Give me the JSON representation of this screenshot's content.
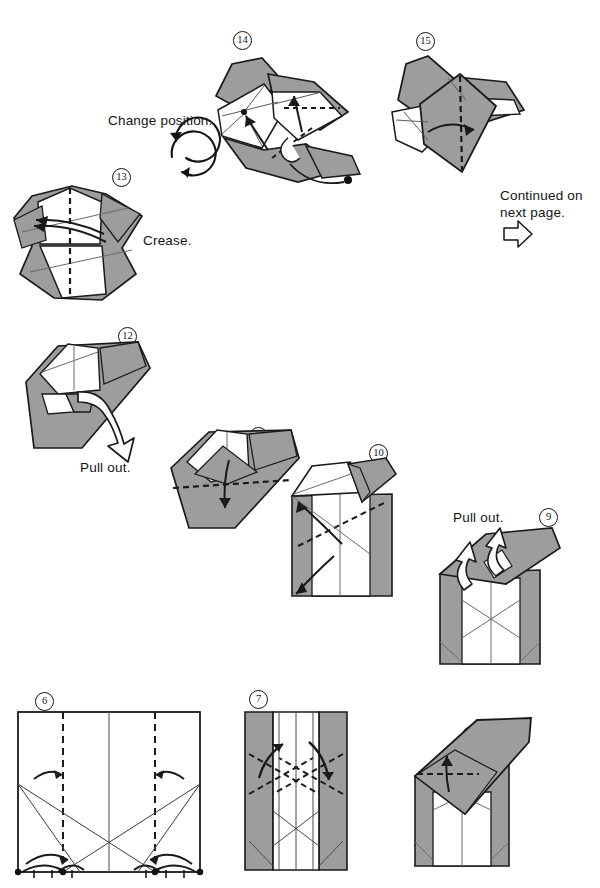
{
  "page": {
    "kind": "origami-instruction-diagram",
    "width": 600,
    "height": 888,
    "background": "#ffffff"
  },
  "colors": {
    "paper_front": "#ffffff",
    "paper_back": "#9d9d9d",
    "paper_back_shade": "#8d8d8d",
    "outline": "#1a1a1a",
    "crease_thin": "#5a5a5a",
    "text": "#141414"
  },
  "captions": [
    {
      "id": "change-position",
      "text": "Change position.",
      "x": 108,
      "y": 120
    },
    {
      "id": "crease",
      "text": "Crease.",
      "x": 143,
      "y": 232
    },
    {
      "id": "continued",
      "line1": "Continued on",
      "line2": "next page.",
      "x": 500,
      "y": 190
    },
    {
      "id": "pull-out-12",
      "text": "Pull out.",
      "x": 80,
      "y": 460
    },
    {
      "id": "pull-out-9",
      "text": "Pull out.",
      "x": 453,
      "y": 510
    }
  ],
  "icons": [
    {
      "name": "rotate-icon",
      "label": "change-position-rotation",
      "x": 163,
      "y": 135,
      "r": 24
    },
    {
      "name": "continue-arrow-icon",
      "label": "hollow-right-arrow",
      "x": 512,
      "y": 228
    }
  ],
  "steps": [
    {
      "number": "6",
      "glyph": "⑥",
      "label_x": 35,
      "label_y": 696,
      "fig_x": 12,
      "fig_y": 708,
      "fig_w": 195,
      "fig_h": 168,
      "caption": "",
      "note": "flat square, two dashed vertical valley folds, thin X creases, four curved arrows, four corner dots"
    },
    {
      "number": "7",
      "glyph": "⑦",
      "label_x": 249,
      "label_y": 694,
      "fig_x": 243,
      "fig_y": 708,
      "fig_w": 105,
      "fig_h": 165,
      "caption": "",
      "note": "rectangle with grey side panels and dashed X folds, two bold arrows"
    },
    {
      "number": "8",
      "glyph": "⑧",
      "label_x": 462,
      "label_y": 730,
      "fig_x": 405,
      "fig_y": 718,
      "fig_w": 140,
      "fig_h": 155,
      "caption": "",
      "note": "grey flap folded up, dashed horizontal fold and arrow up"
    },
    {
      "number": "9",
      "glyph": "⑨",
      "label_x": 539,
      "label_y": 512,
      "fig_x": 430,
      "fig_y": 525,
      "fig_w": 140,
      "fig_h": 145,
      "caption": "Pull out.",
      "note": "box with two hollow pull-out arrows"
    },
    {
      "number": "10",
      "glyph": "⑩",
      "label_x": 369,
      "label_y": 448,
      "fig_x": 285,
      "fig_y": 460,
      "fig_w": 125,
      "fig_h": 170,
      "caption": "",
      "note": "box with grey flap top right, dashed folds and arrows"
    },
    {
      "number": "11",
      "glyph": "⑪",
      "label_x": 249,
      "label_y": 431,
      "fig_x": 168,
      "fig_y": 422,
      "fig_w": 132,
      "fig_h": 110,
      "caption": "",
      "note": "tilted form, long dashed horizontal fold, arrow down"
    },
    {
      "number": "12",
      "glyph": "⑫",
      "label_x": 118,
      "label_y": 331,
      "fig_x": 20,
      "fig_y": 340,
      "fig_w": 140,
      "fig_h": 120,
      "caption": "Pull out.",
      "note": "tilted form with hollow pull-out arrow pointing down-right"
    },
    {
      "number": "13",
      "glyph": "⑬",
      "label_x": 112,
      "label_y": 172,
      "fig_x": 12,
      "fig_y": 182,
      "fig_w": 145,
      "fig_h": 125,
      "caption": "Crease.",
      "note": "dashed vertical centre fold, curved crease arrow to the left"
    },
    {
      "number": "14",
      "glyph": "⑭",
      "label_x": 233,
      "label_y": 35,
      "fig_x": 205,
      "fig_y": 55,
      "fig_w": 155,
      "fig_h": 135,
      "caption": "",
      "note": "rotated form with dashed folds, two arrows and a hollow tuck arrow with dot"
    },
    {
      "number": "15",
      "glyph": "⑮",
      "label_x": 416,
      "label_y": 36,
      "fig_x": 390,
      "fig_y": 52,
      "fig_w": 135,
      "fig_h": 125,
      "caption": "",
      "note": "dashed vertical fold with arrow to the right"
    }
  ]
}
